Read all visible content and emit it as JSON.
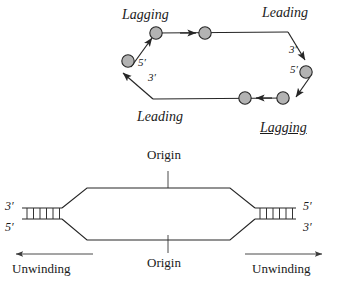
{
  "figure": {
    "colors": {
      "node_fill": "#b3b3b3",
      "node_stroke": "#262626",
      "line": "#262626",
      "text": "#1a1a1a"
    }
  },
  "theta_diagram": {
    "name": "circular-replication-diagram",
    "labels": {
      "lagging_top": "Lagging",
      "leading_top": "Leading",
      "leading_bottom": "Leading",
      "lagging_bottom": "Lagging",
      "five_prime_left": "5′",
      "three_prime_left": "3′",
      "three_prime_right": "3′",
      "five_prime_right": "5′"
    }
  },
  "bubble_diagram": {
    "name": "replication-bubble-diagram",
    "labels": {
      "origin_top": "Origin",
      "origin_bottom": "Origin",
      "left_top_prime": "3′",
      "left_bottom_prime": "5′",
      "right_top_prime": "5′",
      "right_bottom_prime": "3′",
      "unwinding_left": "Unwinding",
      "unwinding_right": "Unwinding"
    },
    "ladder_rungs_left": 6,
    "ladder_rungs_right": 6
  }
}
